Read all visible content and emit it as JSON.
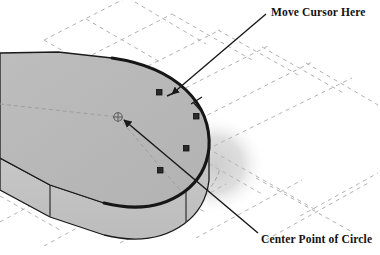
{
  "figure": {
    "background_color": "#ffffff"
  },
  "callouts": [
    {
      "id": "move-cursor-here",
      "label": "Move Cursor Here",
      "target": "curved-edge-vertex-handle",
      "arrow_from": [
        266,
        14
      ],
      "arrow_to": [
        170,
        95
      ]
    },
    {
      "id": "center-point-of-circle",
      "label": "Center Point of Circle",
      "target": "circle-center-marker",
      "arrow_from": [
        258,
        233
      ],
      "arrow_to": [
        120,
        118
      ]
    }
  ],
  "solid": {
    "name": "extruded-rounded-plate",
    "top_face_color": "#b9b9b9",
    "side_face_color": "#c4c4c4",
    "front_face_color": "#bdbdbd",
    "edge_color": "#1a1a1a",
    "highlight_edge_color": "#1c1c1c",
    "shadow_color": "#d8d8d8"
  },
  "grid": {
    "name": "construction-sketch-grid",
    "style": "dashed",
    "color": "#b0b0b0",
    "dash": "4 4"
  },
  "markers": {
    "center_point": {
      "name": "circle-center-marker",
      "symbol": "circle-with-cross",
      "x": 118,
      "y": 117,
      "radius": 4
    },
    "vertex_handles": [
      {
        "x": 159,
        "y": 92
      },
      {
        "x": 196,
        "y": 116
      },
      {
        "x": 186,
        "y": 148
      },
      {
        "x": 160,
        "y": 170
      }
    ],
    "handle_size": 5,
    "handle_color": "#2a2a2a"
  },
  "colors": {
    "text": "#121212",
    "leader_line": "#1a1a1a",
    "background": "#ffffff"
  }
}
